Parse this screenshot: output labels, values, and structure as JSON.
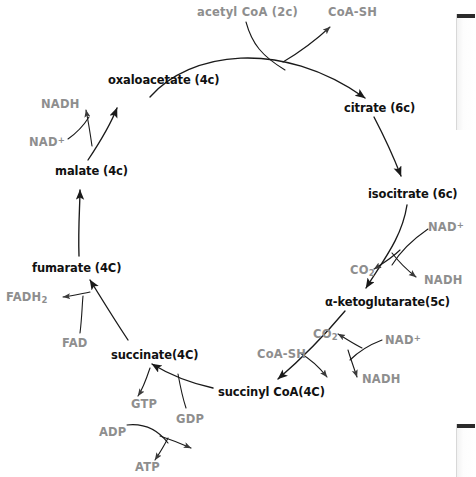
{
  "diagram": {
    "colors": {
      "metabolite_text": "#111111",
      "cofactor_text": "#8e8e8e",
      "arrow": "#1a1a1a",
      "background": "#ffffff"
    },
    "metabolites": [
      {
        "id": "oxaloacetate",
        "label": "oxaloacetate (4c)",
        "x": 108,
        "y": 75
      },
      {
        "id": "citrate",
        "label": "citrate (6c)",
        "x": 344,
        "y": 103
      },
      {
        "id": "isocitrate",
        "label": "isocitrate (6c)",
        "x": 368,
        "y": 189
      },
      {
        "id": "alpha-ketoglutarate",
        "label": "α-ketoglutarate(5c)",
        "x": 325,
        "y": 297
      },
      {
        "id": "succinyl-coa",
        "label": "succinyl CoA(4C)",
        "x": 218,
        "y": 387
      },
      {
        "id": "succinate",
        "label": "succinate(4C)",
        "x": 111,
        "y": 350
      },
      {
        "id": "fumarate",
        "label": "fumarate (4C)",
        "x": 32,
        "y": 263
      },
      {
        "id": "malate",
        "label": "malate (4c)",
        "x": 55,
        "y": 166
      }
    ],
    "cofactors": [
      {
        "id": "acetyl-coa",
        "label": "acetyl CoA (2c)",
        "x": 197,
        "y": 7
      },
      {
        "id": "coa-sh-top",
        "label": "CoA-SH",
        "x": 328,
        "y": 7
      },
      {
        "id": "nadh-malate",
        "label": "NADH",
        "x": 41,
        "y": 99
      },
      {
        "id": "nadplus-malate",
        "label": "NAD",
        "sup": "+",
        "x": 29,
        "y": 136
      },
      {
        "id": "nadplus-isocitrate",
        "label": "NAD",
        "sup": "+",
        "x": 428,
        "y": 221
      },
      {
        "id": "co2-isocitrate",
        "label": "CO",
        "sub": "2",
        "x": 350,
        "y": 265
      },
      {
        "id": "nadh-isocitrate",
        "label": "NADH",
        "x": 424,
        "y": 275
      },
      {
        "id": "co2-akg",
        "label": "CO",
        "sub": "2",
        "x": 313,
        "y": 329
      },
      {
        "id": "nadplus-akg",
        "label": "NAD",
        "sup": "+",
        "x": 385,
        "y": 334
      },
      {
        "id": "coa-sh-akg",
        "label": "CoA-SH",
        "x": 257,
        "y": 349
      },
      {
        "id": "nadh-akg",
        "label": "NADH",
        "x": 362,
        "y": 374
      },
      {
        "id": "fadh2",
        "label": "FADH",
        "sub": "2",
        "x": 6,
        "y": 292
      },
      {
        "id": "fad",
        "label": "FAD",
        "x": 62,
        "y": 338
      },
      {
        "id": "gtp",
        "label": "GTP",
        "x": 131,
        "y": 399
      },
      {
        "id": "gdp",
        "label": "GDP",
        "x": 176,
        "y": 414
      },
      {
        "id": "adp",
        "label": "ADP",
        "x": 99,
        "y": 427
      },
      {
        "id": "atp",
        "label": "ATP",
        "x": 135,
        "y": 462
      }
    ],
    "edge_bars": [
      {
        "id": "top",
        "x": 456,
        "y": 14,
        "width": 18,
        "height": 116
      },
      {
        "id": "bottom",
        "x": 456,
        "y": 424,
        "width": 18,
        "height": 53
      }
    ]
  }
}
